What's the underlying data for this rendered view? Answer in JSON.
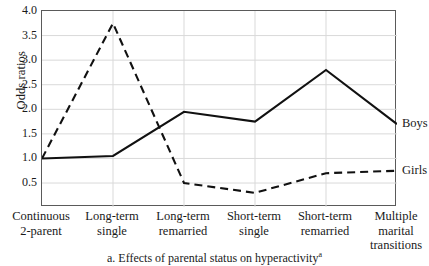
{
  "figure": {
    "caption_prefix": "a.",
    "caption_text": "Effects of parental status on hyperactivity",
    "caption_superscript": "a"
  },
  "axes": {
    "y_title": "Odds ratios",
    "y_ticks": [
      "4.0",
      "3.5",
      "3.0",
      "2.5",
      "2.0",
      "1.5",
      "1.0",
      "0.5"
    ],
    "x_categories": [
      "Continuous\n2-parent",
      "Long-term\nsingle",
      "Long-term\nremarried",
      "Short-term\nsingle",
      "Short-term\nremarried",
      "Multiple\nmarital\ntransitions"
    ]
  },
  "series_labels": {
    "boys": "Boys",
    "girls": "Girls"
  },
  "colors": {
    "line": "#111111",
    "grid": "#d9d9d9",
    "frame": "#5a5a5a",
    "text": "#1a1a1a"
  },
  "chart_data": {
    "type": "line",
    "title": "Effects of parental status on hyperactivity",
    "xlabel": "",
    "ylabel": "Odds ratios",
    "ylim": [
      0.2,
      4.0
    ],
    "yticks": [
      0.5,
      1.0,
      1.5,
      2.0,
      2.5,
      3.0,
      3.5,
      4.0
    ],
    "grid": true,
    "legend": "right-of-plot-line-ends",
    "categories": [
      "Continuous 2-parent",
      "Long-term single",
      "Long-term remarried",
      "Short-term single",
      "Short-term remarried",
      "Multiple marital transitions"
    ],
    "series": [
      {
        "name": "Boys",
        "style": "solid",
        "values": [
          1.0,
          1.05,
          1.95,
          1.75,
          2.8,
          1.7
        ]
      },
      {
        "name": "Girls",
        "style": "dashed",
        "values": [
          1.0,
          3.75,
          0.5,
          0.3,
          0.7,
          0.75
        ]
      }
    ]
  }
}
